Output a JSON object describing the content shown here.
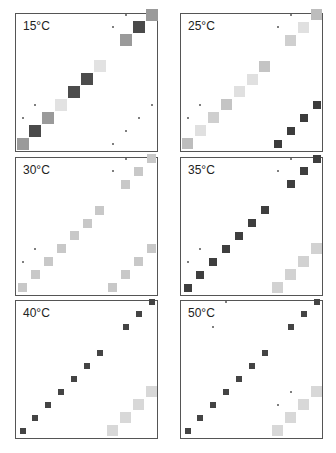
{
  "figure": {
    "grid_steps": 11,
    "step_px": 12.9,
    "panels": [
      {
        "id": "p15",
        "label": "15°C",
        "x": 15,
        "y": 13,
        "diagonal": [
          {
            "i": 0,
            "color": "#9a9a9a",
            "size": 12
          },
          {
            "i": 1,
            "color": "#4a4a4a",
            "size": 12
          },
          {
            "i": 2,
            "color": "#9a9a9a",
            "size": 12
          },
          {
            "i": 3,
            "color": "#e2e2e2",
            "size": 12
          },
          {
            "i": 4,
            "color": "#4c4c4c",
            "size": 12
          },
          {
            "i": 5,
            "color": "#4c4c4c",
            "size": 12
          },
          {
            "i": 6,
            "color": "#e2e2e2",
            "size": 12
          },
          {
            "i": 8,
            "color": "#9a9a9a",
            "size": 12
          },
          {
            "i": 9,
            "color": "#4a4a4a",
            "size": 12
          },
          {
            "i": 10,
            "color": "#9a9a9a",
            "size": 12
          }
        ],
        "anti": [],
        "dots": [
          [
            0,
            2
          ],
          [
            1,
            3
          ],
          [
            7,
            9
          ],
          [
            8,
            10
          ],
          [
            7,
            0
          ],
          [
            8,
            1
          ],
          [
            9,
            2
          ],
          [
            10,
            3
          ]
        ]
      },
      {
        "id": "p25",
        "label": "25°C",
        "x": 180,
        "y": 13,
        "diagonal": [
          {
            "i": 0,
            "color": "#bdbdbd",
            "size": 11
          },
          {
            "i": 1,
            "color": "#e0e0e0",
            "size": 11
          },
          {
            "i": 2,
            "color": "#cfcfcf",
            "size": 11
          },
          {
            "i": 3,
            "color": "#c4c4c4",
            "size": 11
          },
          {
            "i": 4,
            "color": "#e0e0e0",
            "size": 11
          },
          {
            "i": 5,
            "color": "#e0e0e0",
            "size": 11
          },
          {
            "i": 6,
            "color": "#c4c4c4",
            "size": 11
          },
          {
            "i": 8,
            "color": "#cfcfcf",
            "size": 11
          },
          {
            "i": 9,
            "color": "#e0e0e0",
            "size": 11
          },
          {
            "i": 10,
            "color": "#bdbdbd",
            "size": 11
          }
        ],
        "anti": [
          {
            "i": 7,
            "color": "#3c3c3c",
            "size": 8
          },
          {
            "i": 8,
            "color": "#3c3c3c",
            "size": 8
          },
          {
            "i": 9,
            "color": "#3c3c3c",
            "size": 8
          },
          {
            "i": 10,
            "color": "#3c3c3c",
            "size": 8
          }
        ],
        "dots": [
          [
            0,
            2
          ],
          [
            1,
            3
          ],
          [
            7,
            9
          ],
          [
            8,
            10
          ]
        ]
      },
      {
        "id": "p30",
        "label": "30°C",
        "x": 15,
        "y": 157,
        "diagonal": [
          {
            "i": 0,
            "color": "#c8c8c8",
            "size": 9
          },
          {
            "i": 1,
            "color": "#c8c8c8",
            "size": 9
          },
          {
            "i": 2,
            "color": "#c8c8c8",
            "size": 9
          },
          {
            "i": 3,
            "color": "#c8c8c8",
            "size": 9
          },
          {
            "i": 4,
            "color": "#c8c8c8",
            "size": 9
          },
          {
            "i": 5,
            "color": "#c8c8c8",
            "size": 9
          },
          {
            "i": 6,
            "color": "#c8c8c8",
            "size": 9
          },
          {
            "i": 8,
            "color": "#c8c8c8",
            "size": 9
          },
          {
            "i": 9,
            "color": "#c8c8c8",
            "size": 9
          },
          {
            "i": 10,
            "color": "#c8c8c8",
            "size": 9
          }
        ],
        "anti": [
          {
            "i": 7,
            "color": "#c8c8c8",
            "size": 9
          },
          {
            "i": 8,
            "color": "#c8c8c8",
            "size": 9
          },
          {
            "i": 9,
            "color": "#c8c8c8",
            "size": 9
          },
          {
            "i": 10,
            "color": "#c8c8c8",
            "size": 9
          }
        ],
        "dots": [
          [
            0,
            2
          ],
          [
            1,
            3
          ],
          [
            7,
            9
          ],
          [
            8,
            10
          ]
        ]
      },
      {
        "id": "p35",
        "label": "35°C",
        "x": 180,
        "y": 157,
        "diagonal": [
          {
            "i": 0,
            "color": "#3e3e3e",
            "size": 8
          },
          {
            "i": 1,
            "color": "#3e3e3e",
            "size": 8
          },
          {
            "i": 2,
            "color": "#3e3e3e",
            "size": 8
          },
          {
            "i": 3,
            "color": "#3e3e3e",
            "size": 8
          },
          {
            "i": 4,
            "color": "#3e3e3e",
            "size": 8
          },
          {
            "i": 5,
            "color": "#3e3e3e",
            "size": 8
          },
          {
            "i": 6,
            "color": "#3e3e3e",
            "size": 8
          },
          {
            "i": 8,
            "color": "#3e3e3e",
            "size": 8
          },
          {
            "i": 9,
            "color": "#3e3e3e",
            "size": 8
          },
          {
            "i": 10,
            "color": "#3e3e3e",
            "size": 8
          }
        ],
        "anti": [
          {
            "i": 7,
            "color": "#d2d2d2",
            "size": 11
          },
          {
            "i": 8,
            "color": "#d2d2d2",
            "size": 11
          },
          {
            "i": 9,
            "color": "#d2d2d2",
            "size": 11
          },
          {
            "i": 10,
            "color": "#d2d2d2",
            "size": 11
          }
        ],
        "dots": [
          [
            0,
            2
          ],
          [
            1,
            3
          ],
          [
            7,
            9
          ],
          [
            8,
            10
          ]
        ]
      },
      {
        "id": "p40",
        "label": "40°C",
        "x": 15,
        "y": 300,
        "diagonal": [
          {
            "i": 0,
            "color": "#444444",
            "size": 6
          },
          {
            "i": 1,
            "color": "#444444",
            "size": 6
          },
          {
            "i": 2,
            "color": "#444444",
            "size": 6
          },
          {
            "i": 3,
            "color": "#444444",
            "size": 6
          },
          {
            "i": 4,
            "color": "#444444",
            "size": 6
          },
          {
            "i": 5,
            "color": "#444444",
            "size": 6
          },
          {
            "i": 6,
            "color": "#444444",
            "size": 6
          },
          {
            "i": 8,
            "color": "#444444",
            "size": 6
          },
          {
            "i": 9,
            "color": "#444444",
            "size": 6
          },
          {
            "i": 10,
            "color": "#444444",
            "size": 6
          }
        ],
        "anti": [
          {
            "i": 7,
            "color": "#d8d8d8",
            "size": 11
          },
          {
            "i": 8,
            "color": "#d8d8d8",
            "size": 11
          },
          {
            "i": 9,
            "color": "#d8d8d8",
            "size": 11
          },
          {
            "i": 10,
            "color": "#d8d8d8",
            "size": 11
          }
        ],
        "dots": []
      },
      {
        "id": "p50",
        "label": "50°C",
        "x": 180,
        "y": 300,
        "diagonal": [
          {
            "i": 0,
            "color": "#444444",
            "size": 6
          },
          {
            "i": 1,
            "color": "#444444",
            "size": 6
          },
          {
            "i": 2,
            "color": "#444444",
            "size": 6
          },
          {
            "i": 3,
            "color": "#444444",
            "size": 6
          },
          {
            "i": 4,
            "color": "#444444",
            "size": 6
          },
          {
            "i": 5,
            "color": "#444444",
            "size": 6
          },
          {
            "i": 6,
            "color": "#444444",
            "size": 6
          },
          {
            "i": 8,
            "color": "#444444",
            "size": 6
          },
          {
            "i": 9,
            "color": "#444444",
            "size": 6
          },
          {
            "i": 10,
            "color": "#444444",
            "size": 6
          }
        ],
        "anti": [
          {
            "i": 7,
            "color": "#d8d8d8",
            "size": 11
          },
          {
            "i": 8,
            "color": "#d8d8d8",
            "size": 11
          },
          {
            "i": 9,
            "color": "#d8d8d8",
            "size": 11
          },
          {
            "i": 10,
            "color": "#d8d8d8",
            "size": 11
          }
        ],
        "dots": [
          [
            2,
            8
          ],
          [
            3,
            10
          ],
          [
            7,
            2
          ],
          [
            8,
            3
          ]
        ]
      }
    ]
  }
}
